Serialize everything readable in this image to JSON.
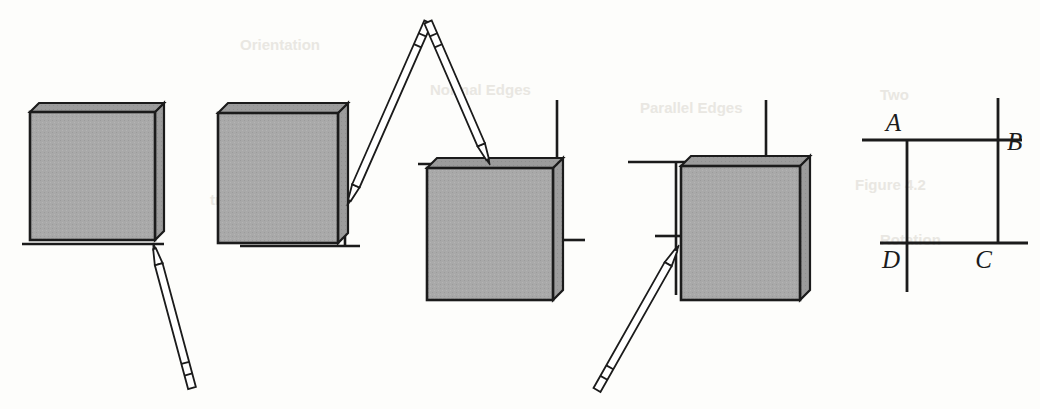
{
  "figure": {
    "background_color": "#fdfdfb",
    "ink_color": "#1b1b1b",
    "block_fill_color": "#a9a9a9",
    "block_edge_color": "#1b1b1b",
    "block_side_fill_color": "#9a9a9a",
    "width": 1040,
    "height": 409
  },
  "panels": [
    {
      "id": "panel-1",
      "name": "step-1-block-on-baseline",
      "block": {
        "x": 30,
        "y": 112,
        "w": 125,
        "h": 128,
        "depth": 9
      },
      "guide_lines": [
        {
          "name": "baseline-horizontal",
          "x1": 22,
          "y1": 244,
          "x2": 164,
          "y2": 244
        }
      ],
      "pencil": {
        "name": "stylus-pointing-up-left",
        "tip_x": 153,
        "tip_y": 243,
        "end_x": 192,
        "end_y": 388,
        "width": 8
      }
    },
    {
      "id": "panel-2",
      "name": "step-2-block-with-right-guide",
      "block": {
        "x": 218,
        "y": 113,
        "w": 120,
        "h": 130,
        "depth": 10
      },
      "guide_lines": [
        {
          "name": "baseline-horizontal",
          "x1": 240,
          "y1": 246,
          "x2": 360,
          "y2": 246
        },
        {
          "name": "right-vertical",
          "x1": 345,
          "y1": 110,
          "x2": 345,
          "y2": 246
        }
      ],
      "pencil": {
        "name": "stylus-pointing-down-left",
        "tip_x": 347,
        "tip_y": 206,
        "end_x": 428,
        "end_y": 22,
        "width": 8
      }
    },
    {
      "id": "panel-3",
      "name": "step-3-block-rotated-under-top-guide",
      "block": {
        "x": 427,
        "y": 168,
        "w": 126,
        "h": 132,
        "depth": 10
      },
      "guide_lines": [
        {
          "name": "top-horizontal",
          "x1": 418,
          "y1": 164,
          "x2": 560,
          "y2": 164
        },
        {
          "name": "right-vertical",
          "x1": 557,
          "y1": 100,
          "x2": 557,
          "y2": 242
        },
        {
          "name": "right-stub-horizontal",
          "x1": 557,
          "y1": 240,
          "x2": 585,
          "y2": 240
        }
      ],
      "pencil": {
        "name": "stylus-pointing-down",
        "tip_x": 490,
        "tip_y": 165,
        "end_x": 428,
        "end_y": 22,
        "width": 8
      }
    },
    {
      "id": "panel-4",
      "name": "step-4-block-with-left-guide",
      "block": {
        "x": 681,
        "y": 166,
        "w": 119,
        "h": 134,
        "depth": 10
      },
      "guide_lines": [
        {
          "name": "top-left-horizontal",
          "x1": 628,
          "y1": 162,
          "x2": 770,
          "y2": 162
        },
        {
          "name": "left-vertical",
          "x1": 676,
          "y1": 162,
          "x2": 676,
          "y2": 295
        },
        {
          "name": "left-stub-horizontal",
          "x1": 655,
          "y1": 236,
          "x2": 681,
          "y2": 236
        },
        {
          "name": "top-right-vertical",
          "x1": 766,
          "y1": 100,
          "x2": 766,
          "y2": 166
        }
      ],
      "pencil": {
        "name": "stylus-pointing-up-right",
        "tip_x": 679,
        "tip_y": 245,
        "end_x": 597,
        "end_y": 390,
        "width": 8
      }
    }
  ],
  "reference_diagram": {
    "id": "panel-5",
    "name": "corner-reference-square",
    "lines": [
      {
        "name": "top-horizontal",
        "x1": 862,
        "y1": 140,
        "x2": 1022,
        "y2": 140
      },
      {
        "name": "bottom-horizontal",
        "x1": 880,
        "y1": 243,
        "x2": 1028,
        "y2": 243
      },
      {
        "name": "left-vertical",
        "x1": 907,
        "y1": 140,
        "x2": 907,
        "y2": 292
      },
      {
        "name": "right-vertical",
        "x1": 998,
        "y1": 98,
        "x2": 998,
        "y2": 243
      }
    ],
    "labels": [
      {
        "name": "vertex-label-a",
        "text": "A",
        "x": 901,
        "y": 131,
        "anchor": "end"
      },
      {
        "name": "vertex-label-b",
        "text": "B",
        "x": 1007,
        "y": 150,
        "anchor": "start"
      },
      {
        "name": "vertex-label-c",
        "text": "C",
        "x": 992,
        "y": 268,
        "anchor": "end"
      },
      {
        "name": "vertex-label-d",
        "text": "D",
        "x": 900,
        "y": 268,
        "anchor": "end"
      }
    ]
  },
  "background_bleed_text": [
    {
      "name": "bleed-line-1",
      "text": "Parallel Edges",
      "x": 640,
      "y": 113
    },
    {
      "name": "bleed-line-2",
      "text": "Normal Edges",
      "x": 430,
      "y": 95
    },
    {
      "name": "bleed-line-3",
      "text": "Two",
      "x": 880,
      "y": 100
    },
    {
      "name": "bleed-line-4",
      "text": "Figure 4.2",
      "x": 855,
      "y": 190
    },
    {
      "name": "bleed-line-5",
      "text": "Rotation",
      "x": 880,
      "y": 245
    },
    {
      "name": "bleed-line-6",
      "text": "Orientation",
      "x": 240,
      "y": 50
    },
    {
      "name": "bleed-line-7",
      "text": "transformation",
      "x": 210,
      "y": 205
    }
  ]
}
